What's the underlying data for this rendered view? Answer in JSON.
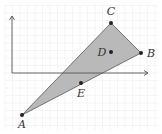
{
  "diagram": {
    "type": "coordinate-geometry",
    "grid": true,
    "axes": {
      "origin_px": [
        12,
        73
      ],
      "x_end_px": 148,
      "y_end_px": 16
    },
    "triangle": {
      "vertices": [
        "A",
        "B",
        "C"
      ],
      "fill": "#b9b9b9",
      "stroke": "#555555"
    },
    "points": [
      {
        "name": "A",
        "label": "A",
        "px": [
          22,
          115
        ],
        "label_px": [
          22,
          128
        ]
      },
      {
        "name": "B",
        "label": "B",
        "px": [
          141,
          53
        ],
        "label_px": [
          151,
          57
        ]
      },
      {
        "name": "C",
        "label": "C",
        "px": [
          111,
          23
        ],
        "label_px": [
          111,
          15
        ]
      },
      {
        "name": "D",
        "label": "D",
        "px": [
          111,
          52
        ],
        "label_px": [
          102,
          56
        ]
      },
      {
        "name": "E",
        "label": "E",
        "px": [
          81,
          83
        ],
        "label_px": [
          81,
          97
        ]
      }
    ],
    "colors": {
      "axis": "#555555",
      "grid": "#eeeeee",
      "point": "#222222"
    }
  }
}
